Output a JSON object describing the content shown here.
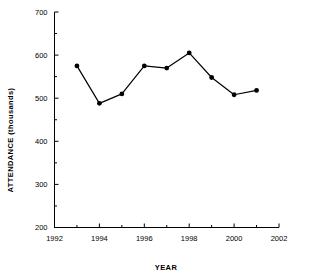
{
  "chart_data": {
    "type": "line",
    "title": "",
    "xlabel": "YEAR",
    "ylabel": "ATTENDANCE (thousands)",
    "x": [
      1993,
      1994,
      1995,
      1996,
      1997,
      1998,
      1999,
      2000,
      2001
    ],
    "values": [
      575,
      488,
      510,
      575,
      570,
      605,
      548,
      508,
      518
    ],
    "series": [
      {
        "name": "Attendance",
        "values": [
          575,
          488,
          510,
          575,
          570,
          605,
          548,
          508,
          518
        ]
      }
    ],
    "xlim": [
      1992,
      2002
    ],
    "ylim": [
      200,
      700
    ],
    "x_ticks": [
      1992,
      1994,
      1996,
      1998,
      2000,
      2002
    ],
    "x_tick_labels": [
      "1992",
      "1994",
      "1996",
      "1998",
      "2000",
      "2002"
    ],
    "x_minor_ticks": [
      1993,
      1995,
      1997,
      1999,
      2001
    ],
    "y_ticks": [
      200,
      300,
      400,
      500,
      600,
      700
    ],
    "y_tick_labels": [
      "200",
      "300",
      "400",
      "500",
      "600",
      "700"
    ],
    "y_minor_ticks": [
      250,
      350,
      450,
      550,
      650
    ],
    "grid": false,
    "legend": false,
    "marker": "filled-circle",
    "line_color": "#000000",
    "marker_color": "#000000",
    "axis_color": "#000000",
    "background_color": "#ffffff"
  },
  "axis": {
    "y_label": "ATTENDANCE (thousands)",
    "x_label": "YEAR",
    "y_tick_labels": [
      "700",
      "600",
      "500",
      "400",
      "300",
      "200"
    ],
    "x_tick_labels": [
      "1992",
      "1994",
      "1996",
      "1998",
      "2000",
      "2002"
    ]
  }
}
